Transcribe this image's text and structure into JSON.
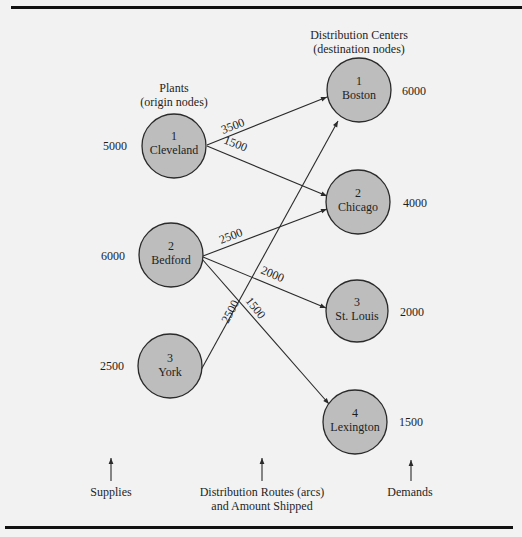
{
  "headers": {
    "plants_line1": "Plants",
    "plants_line2": "(origin nodes)",
    "dc_line1": "Distribution Centers",
    "dc_line2": "(destination nodes)"
  },
  "origins": [
    {
      "id": "1",
      "name": "Cleveland",
      "supply": "5000"
    },
    {
      "id": "2",
      "name": "Bedford",
      "supply": "6000"
    },
    {
      "id": "3",
      "name": "York",
      "supply": "2500"
    }
  ],
  "destinations": [
    {
      "id": "1",
      "name": "Boston",
      "demand": "6000"
    },
    {
      "id": "2",
      "name": "Chicago",
      "demand": "4000"
    },
    {
      "id": "3",
      "name": "St. Louis",
      "demand": "2000"
    },
    {
      "id": "4",
      "name": "Lexington",
      "demand": "1500"
    }
  ],
  "routes": [
    {
      "from": "Cleveland",
      "to": "Boston",
      "amount": "3500"
    },
    {
      "from": "Cleveland",
      "to": "Chicago",
      "amount": "1500"
    },
    {
      "from": "Bedford",
      "to": "Chicago",
      "amount": "2500"
    },
    {
      "from": "Bedford",
      "to": "St. Louis",
      "amount": "2000"
    },
    {
      "from": "Bedford",
      "to": "Lexington",
      "amount": "1500"
    },
    {
      "from": "York",
      "to": "Boston",
      "amount": "2500"
    }
  ],
  "footer": {
    "supplies": "Supplies",
    "routes_line1": "Distribution Routes (arcs)",
    "routes_line2": "and Amount Shipped",
    "demands": "Demands"
  },
  "colors": {
    "background": "#f2f2f2",
    "node_fill": "#bdbdbd",
    "line": "#2a2a2a",
    "rule": "#111111"
  }
}
